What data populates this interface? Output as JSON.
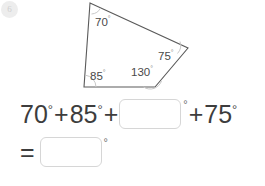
{
  "badge": {
    "label": "6"
  },
  "figure": {
    "name": "quadrilateral-diagram",
    "shape": "quadrilateral",
    "stroke_color": "#5a5a5a",
    "vertices": [
      {
        "id": "top",
        "x": 90,
        "y": 3
      },
      {
        "id": "right",
        "x": 188,
        "y": 48
      },
      {
        "id": "bottom-right",
        "x": 155,
        "y": 87
      },
      {
        "id": "bottom-left",
        "x": 84,
        "y": 87
      }
    ],
    "angles": [
      {
        "id": "angle-top",
        "value": "70",
        "degree_symbol": "°",
        "label_x": 95,
        "label_y": 22
      },
      {
        "id": "angle-right",
        "value": "75",
        "degree_symbol": "°",
        "label_x": 158,
        "label_y": 56
      },
      {
        "id": "angle-bottom-right",
        "value": "130",
        "degree_symbol": "°",
        "label_x": 134,
        "label_y": 73
      },
      {
        "id": "angle-bottom-left",
        "value": "85",
        "degree_symbol": "°",
        "label_x": 91,
        "label_y": 76
      }
    ]
  },
  "equation": {
    "line1": {
      "term1": "70",
      "deg1": "°",
      "plus1": "+",
      "term2": "85",
      "deg2": "°",
      "plus2": "+",
      "blank_value": "",
      "blank_placeholder": "",
      "blank_deg": "°",
      "plus3": "+",
      "term3": "75",
      "deg3": "°"
    },
    "line2": {
      "equals": "=",
      "blank_value": "",
      "blank_placeholder": "",
      "blank_deg": "°"
    }
  }
}
